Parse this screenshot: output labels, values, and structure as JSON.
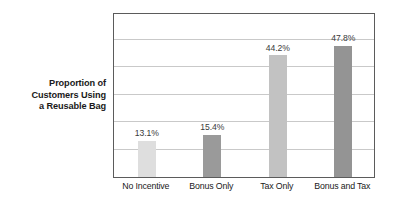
{
  "chart_data": {
    "type": "bar",
    "title": "",
    "xlabel": "",
    "ylabel": "Proportion of Customers Using a Reusable Bag",
    "ylabel_lines": [
      "Proportion of",
      "Customers Using",
      "a Reusable Bag"
    ],
    "categories": [
      "No Incentive",
      "Bonus Only",
      "Tax Only",
      "Bonus and Tax"
    ],
    "values": [
      13.1,
      15.4,
      44.2,
      47.8
    ],
    "value_labels": [
      "13.1%",
      "15.4%",
      "44.2%",
      "47.8%"
    ],
    "bar_colors": [
      "#dedede",
      "#9a9a9a",
      "#c2c2c2",
      "#949494"
    ],
    "ylim": [
      0,
      60
    ],
    "gridlines": [
      10,
      20,
      30,
      40,
      50
    ],
    "grid": true,
    "grid_color": "#c9c9c9",
    "frame_color": "#5b5b5b",
    "legend": "none",
    "background": "#ffffff"
  }
}
